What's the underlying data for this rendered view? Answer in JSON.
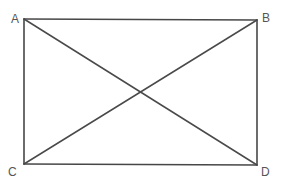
{
  "diagram": {
    "type": "rectangle-with-diagonals",
    "stroke_color": "#474747",
    "background": "#ffffff",
    "vertices": [
      {
        "id": "A",
        "label": "A",
        "x": 24,
        "y": 19,
        "label_x": 11,
        "label_y": 13
      },
      {
        "id": "B",
        "label": "B",
        "x": 257,
        "y": 20,
        "label_x": 262,
        "label_y": 12
      },
      {
        "id": "C",
        "label": "C",
        "x": 24,
        "y": 164,
        "label_x": 8,
        "label_y": 166
      },
      {
        "id": "D",
        "label": "D",
        "x": 257,
        "y": 165,
        "label_x": 261,
        "label_y": 166
      }
    ],
    "edges": [
      {
        "from": "A",
        "to": "B",
        "kind": "side"
      },
      {
        "from": "B",
        "to": "D",
        "kind": "side"
      },
      {
        "from": "D",
        "to": "C",
        "kind": "side"
      },
      {
        "from": "C",
        "to": "A",
        "kind": "side"
      },
      {
        "from": "A",
        "to": "D",
        "kind": "diagonal"
      },
      {
        "from": "C",
        "to": "B",
        "kind": "diagonal"
      }
    ]
  }
}
